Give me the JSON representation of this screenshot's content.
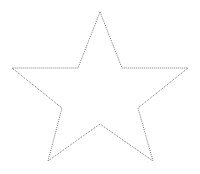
{
  "canvas": {
    "width": 200,
    "height": 174,
    "background_color": "#ffffff"
  },
  "figure": {
    "name": "five-pointed-star",
    "shape_type": "star",
    "points": 5,
    "stroke_color": "#555555",
    "stroke_width": 0.8,
    "fill": "none",
    "stroke_style": "dotted",
    "dash_pattern": "1 1",
    "center_x": 100,
    "center_y": 84,
    "outer_radius": 76,
    "inner_radius": 30,
    "bounding_box": {
      "left": 12,
      "top": 12,
      "right": 188,
      "bottom": 161
    },
    "polygon_points": "100,12 122,68 188,68 138,108 153,161 100,124 48,161 62,108 12,68 78,68",
    "vertices": [
      {
        "label": "top-outer",
        "kind": "outer",
        "x": 100,
        "y": 12
      },
      {
        "label": "upper-right-inner",
        "kind": "inner",
        "x": 122,
        "y": 68
      },
      {
        "label": "right-outer",
        "kind": "outer",
        "x": 188,
        "y": 68
      },
      {
        "label": "lower-right-inner",
        "kind": "inner",
        "x": 138,
        "y": 108
      },
      {
        "label": "bottom-right-outer",
        "kind": "outer",
        "x": 153,
        "y": 161
      },
      {
        "label": "bottom-inner",
        "kind": "inner",
        "x": 100,
        "y": 124
      },
      {
        "label": "bottom-left-outer",
        "kind": "outer",
        "x": 48,
        "y": 161
      },
      {
        "label": "lower-left-inner",
        "kind": "inner",
        "x": 62,
        "y": 108
      },
      {
        "label": "left-outer",
        "kind": "outer",
        "x": 12,
        "y": 68
      },
      {
        "label": "upper-left-inner",
        "kind": "inner",
        "x": 78,
        "y": 68
      }
    ]
  }
}
